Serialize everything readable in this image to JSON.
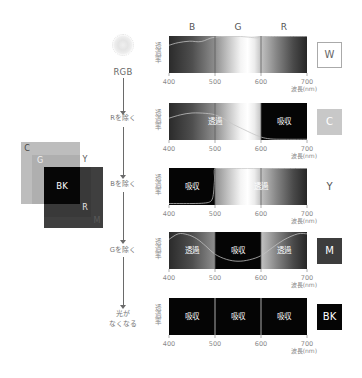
{
  "figure": {
    "source_label": "RGB",
    "bands": [
      {
        "label": "B",
        "from_nm": 400,
        "to_nm": 500
      },
      {
        "label": "G",
        "from_nm": 500,
        "to_nm": 600
      },
      {
        "label": "R",
        "from_nm": 600,
        "to_nm": 700
      }
    ]
  },
  "steps": [
    {
      "lines": [
        "Rを除く"
      ]
    },
    {
      "lines": [
        "Bを除く"
      ]
    },
    {
      "lines": [
        "Gを除く"
      ]
    },
    {
      "lines": [
        "光が",
        "なくなる"
      ]
    }
  ],
  "venn": {
    "labels": {
      "c": "C",
      "g": "G",
      "y": "Y",
      "bk": "BK",
      "r": "R",
      "m": "M"
    },
    "colors": {
      "c": "#bdbdbd",
      "y": "#ffffff",
      "g": "#afafaf",
      "m": "#3f3f3f",
      "r": "#393939",
      "bk": "#060606"
    }
  },
  "chart_data": [
    {
      "type": "line",
      "ink": "W",
      "ink_box": {
        "fill": "#ffffff",
        "text": "#666666",
        "border": "#aaaaaa"
      },
      "xlabel": "波長(nm)",
      "ylabel": "透過率",
      "xlim": [
        400,
        700
      ],
      "ylim": [
        0,
        100
      ],
      "x_ticks": [
        400,
        500,
        600,
        700
      ],
      "dividers": [
        500,
        600
      ],
      "regions": [
        {
          "from": 400,
          "to": 700,
          "state": "transmit",
          "label": ""
        }
      ],
      "series": [
        {
          "name": "transmittance",
          "x": [
            400,
            420,
            445,
            470,
            500,
            550,
            590,
            600,
            650,
            700
          ],
          "y": [
            75,
            82,
            86,
            85,
            97,
            99,
            95,
            98,
            99,
            99
          ]
        }
      ]
    },
    {
      "type": "line",
      "ink": "C",
      "ink_box": {
        "fill": "#c8c8c8",
        "text": "#ffffff",
        "border": "#c8c8c8"
      },
      "xlabel": "波長(nm)",
      "ylabel": "透過率",
      "xlim": [
        400,
        700
      ],
      "ylim": [
        0,
        100
      ],
      "x_ticks": [
        400,
        500,
        600,
        700
      ],
      "dividers": [
        500,
        600
      ],
      "regions": [
        {
          "from": 400,
          "to": 600,
          "state": "transmit",
          "label": "透過"
        },
        {
          "from": 600,
          "to": 700,
          "state": "absorb",
          "label": "吸収"
        }
      ],
      "series": [
        {
          "name": "transmittance",
          "x": [
            400,
            425,
            450,
            480,
            500,
            520,
            540,
            560,
            580,
            600,
            620,
            650,
            700
          ],
          "y": [
            59,
            68,
            73,
            72,
            68,
            57,
            42,
            30,
            18,
            8,
            3,
            2,
            2
          ]
        }
      ]
    },
    {
      "type": "line",
      "ink": "Y",
      "ink_box": {
        "fill": "#ffffff",
        "text": "#555555",
        "border": "#ffffff"
      },
      "xlabel": "波長(nm)",
      "ylabel": "透過率",
      "xlim": [
        400,
        700
      ],
      "ylim": [
        0,
        100
      ],
      "x_ticks": [
        400,
        500,
        600,
        700
      ],
      "dividers": [
        500,
        600
      ],
      "regions": [
        {
          "from": 400,
          "to": 500,
          "state": "absorb",
          "label": "吸収"
        },
        {
          "from": 500,
          "to": 700,
          "state": "transmit",
          "label": "透過"
        }
      ],
      "series": [
        {
          "name": "transmittance",
          "x": [
            400,
            450,
            475,
            488,
            494,
            497,
            499,
            500,
            520,
            700
          ],
          "y": [
            4,
            4,
            5,
            8,
            16,
            35,
            70,
            99,
            99,
            99
          ]
        }
      ]
    },
    {
      "type": "line",
      "ink": "M",
      "ink_box": {
        "fill": "#3d3d3d",
        "text": "#ffffff",
        "border": "#3d3d3d"
      },
      "xlabel": "波長(nm)",
      "ylabel": "透過率",
      "xlim": [
        400,
        700
      ],
      "ylim": [
        0,
        100
      ],
      "x_ticks": [
        400,
        500,
        600,
        700
      ],
      "dividers": [
        500,
        600
      ],
      "regions": [
        {
          "from": 400,
          "to": 500,
          "state": "transmit",
          "label": "透過"
        },
        {
          "from": 500,
          "to": 600,
          "state": "absorb",
          "label": "吸収"
        },
        {
          "from": 600,
          "to": 700,
          "state": "transmit",
          "label": "透過"
        }
      ],
      "series": [
        {
          "name": "transmittance",
          "x": [
            400,
            420,
            440,
            460,
            480,
            500,
            525,
            550,
            575,
            600,
            625,
            650,
            680,
            700
          ],
          "y": [
            80,
            95,
            93,
            82,
            62,
            40,
            26,
            21,
            25,
            36,
            58,
            79,
            95,
            95
          ]
        }
      ]
    },
    {
      "type": "line",
      "ink": "BK",
      "ink_box": {
        "fill": "#050505",
        "text": "#ffffff",
        "border": "#050505"
      },
      "xlabel": "波長(nm)",
      "ylabel": "透過率",
      "xlim": [
        400,
        700
      ],
      "ylim": [
        0,
        100
      ],
      "x_ticks": [
        400,
        500,
        600,
        700
      ],
      "dividers": [
        500,
        600
      ],
      "regions": [
        {
          "from": 400,
          "to": 500,
          "state": "absorb",
          "label": "吸収"
        },
        {
          "from": 500,
          "to": 600,
          "state": "absorb",
          "label": "吸収"
        },
        {
          "from": 600,
          "to": 700,
          "state": "absorb",
          "label": "吸収"
        }
      ],
      "series": []
    }
  ]
}
